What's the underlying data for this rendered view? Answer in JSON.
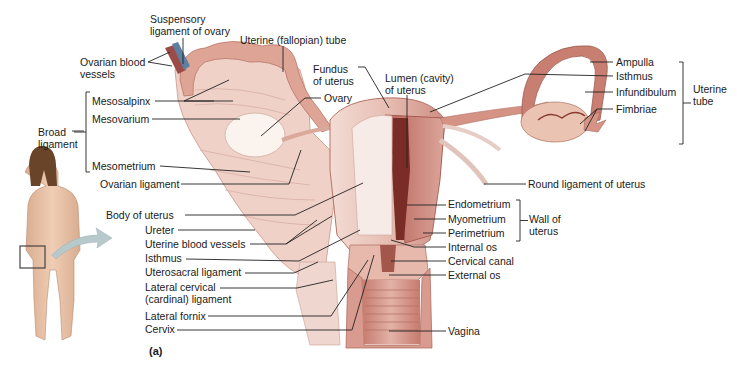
{
  "figure": {
    "panel_label": "(a)",
    "colors": {
      "tissue_light": "#f1d6cf",
      "tissue_mid": "#dba79c",
      "tissue_dark": "#a8554a",
      "lumen": "#7b2a26",
      "ovary": "#f6ece6",
      "tube": "#c97d70",
      "skin": "#e8c2a6",
      "hair": "#5a3a22",
      "arrow": "#b6c7c9",
      "leader": "#222222"
    }
  },
  "labels": [
    {
      "id": "suspensory-ligament",
      "text": "Suspensory\nligament of ovary",
      "x": 150,
      "y": 13,
      "lines": [
        [
          183,
          38,
          183,
          64
        ]
      ]
    },
    {
      "id": "ovarian-blood-vessels",
      "text": "Ovarian blood\nvessels",
      "x": 80,
      "y": 56,
      "lines": [
        [
          148,
          62,
          170,
          52
        ],
        [
          148,
          62,
          172,
          66
        ]
      ]
    },
    {
      "id": "uterine-tube-label",
      "text": "Uterine (fallopian) tube",
      "x": 240,
      "y": 34,
      "lines": [
        [
          283,
          46,
          283,
          72
        ]
      ]
    },
    {
      "id": "fundus",
      "text": "Fundus\nof uterus",
      "x": 313,
      "y": 63,
      "lines": [
        [
          358,
          67,
          365,
          67
        ],
        [
          365,
          67,
          389,
          108
        ]
      ]
    },
    {
      "id": "lumen",
      "text": "Lumen (cavity)\nof uterus",
      "x": 385,
      "y": 72,
      "lines": [
        [
          407,
          95,
          407,
          168
        ]
      ]
    },
    {
      "id": "ovary",
      "text": "Ovary",
      "x": 324,
      "y": 92,
      "lines": [
        [
          321,
          98,
          305,
          98
        ],
        [
          305,
          98,
          261,
          136
        ]
      ]
    },
    {
      "id": "mesosalpinx",
      "text": "Mesosalpinx",
      "x": 92,
      "y": 95,
      "lines": [
        [
          155,
          101,
          214,
          101
        ],
        [
          184,
          101,
          229,
          80
        ],
        [
          184,
          101,
          233,
          101
        ]
      ]
    },
    {
      "id": "mesovarium",
      "text": "Mesovarium",
      "x": 92,
      "y": 113,
      "lines": [
        [
          152,
          119,
          240,
          119
        ]
      ]
    },
    {
      "id": "broad-ligament",
      "text": "Broad\nligament",
      "x": 38,
      "y": 126,
      "lines": [
        [
          72,
          131,
          84,
          131
        ]
      ]
    },
    {
      "id": "mesometrium",
      "text": "Mesometrium",
      "x": 92,
      "y": 160,
      "lines": [
        [
          160,
          166,
          250,
          172
        ]
      ]
    },
    {
      "id": "ovarian-ligament",
      "text": "Ovarian ligament",
      "x": 100,
      "y": 178,
      "lines": [
        [
          181,
          184,
          289,
          184
        ],
        [
          289,
          184,
          301,
          150
        ]
      ]
    },
    {
      "id": "ampulla",
      "text": "Ampulla",
      "x": 616,
      "y": 56,
      "lines": [
        [
          590,
          62,
          613,
          62
        ]
      ]
    },
    {
      "id": "isthmus-tube",
      "text": "Isthmus",
      "x": 616,
      "y": 70,
      "lines": [
        [
          430,
          112,
          525,
          74
        ],
        [
          525,
          74,
          613,
          76
        ]
      ]
    },
    {
      "id": "infundibulum",
      "text": "Infundibulum",
      "x": 616,
      "y": 86,
      "lines": [
        [
          585,
          92,
          613,
          92
        ]
      ]
    },
    {
      "id": "fimbriae",
      "text": "Fimbriae",
      "x": 616,
      "y": 103,
      "lines": [
        [
          597,
          109,
          613,
          109
        ],
        [
          597,
          109,
          580,
          124
        ],
        [
          597,
          109,
          585,
          131
        ]
      ]
    },
    {
      "id": "uterine-tube-bracket",
      "text": "Uterine\ntube",
      "x": 693,
      "y": 83,
      "lines": []
    },
    {
      "id": "round-ligament",
      "text": "Round ligament of uterus",
      "x": 528,
      "y": 178,
      "lines": [
        [
          484,
          184,
          526,
          184
        ]
      ]
    },
    {
      "id": "endometrium",
      "text": "Endometrium",
      "x": 448,
      "y": 198,
      "lines": [
        [
          407,
          205,
          446,
          205
        ]
      ]
    },
    {
      "id": "myometrium",
      "text": "Myometrium",
      "x": 448,
      "y": 213,
      "lines": [
        [
          414,
          219,
          446,
          219
        ]
      ]
    },
    {
      "id": "perimetrium",
      "text": "Perimetrium",
      "x": 448,
      "y": 227,
      "lines": [
        [
          423,
          233,
          446,
          233
        ]
      ]
    },
    {
      "id": "wall-of-uterus",
      "text": "Wall of\nuterus",
      "x": 529,
      "y": 213,
      "lines": []
    },
    {
      "id": "internal-os",
      "text": "Internal os",
      "x": 448,
      "y": 241,
      "lines": [
        [
          391,
          240,
          414,
          247
        ],
        [
          414,
          247,
          446,
          247
        ]
      ]
    },
    {
      "id": "cervical-canal",
      "text": "Cervical canal",
      "x": 448,
      "y": 255,
      "lines": [
        [
          391,
          261,
          446,
          261
        ]
      ]
    },
    {
      "id": "external-os",
      "text": "External os",
      "x": 448,
      "y": 269,
      "lines": [
        [
          389,
          275,
          446,
          275
        ]
      ]
    },
    {
      "id": "vagina",
      "text": "Vagina",
      "x": 448,
      "y": 325,
      "lines": [
        [
          389,
          331,
          446,
          331
        ]
      ]
    },
    {
      "id": "body-of-uterus",
      "text": "Body of uterus",
      "x": 106,
      "y": 209,
      "lines": [
        [
          185,
          215,
          295,
          215
        ],
        [
          295,
          215,
          363,
          183
        ]
      ]
    },
    {
      "id": "ureter",
      "text": "Ureter",
      "x": 145,
      "y": 224,
      "lines": [
        [
          178,
          230,
          255,
          230
        ]
      ]
    },
    {
      "id": "uterine-blood-vessels",
      "text": "Uterine blood vessels",
      "x": 145,
      "y": 238,
      "lines": [
        [
          250,
          244,
          286,
          244
        ],
        [
          286,
          244,
          317,
          220
        ],
        [
          286,
          244,
          332,
          216
        ]
      ]
    },
    {
      "id": "isthmus-uterus",
      "text": "Isthmus",
      "x": 145,
      "y": 252,
      "lines": [
        [
          186,
          259,
          299,
          261
        ],
        [
          299,
          261,
          360,
          230
        ]
      ]
    },
    {
      "id": "uterosacral-ligament",
      "text": "Uterosacral ligament",
      "x": 145,
      "y": 266,
      "lines": [
        [
          245,
          273,
          294,
          273
        ],
        [
          294,
          273,
          318,
          262
        ]
      ]
    },
    {
      "id": "lateral-cervical-ligament",
      "text": "Lateral cervical\n(cardinal) ligament",
      "x": 145,
      "y": 281,
      "lines": [
        [
          220,
          288,
          297,
          288
        ],
        [
          297,
          288,
          333,
          280
        ]
      ]
    },
    {
      "id": "lateral-fornix",
      "text": "Lateral fornix",
      "x": 145,
      "y": 310,
      "lines": [
        [
          208,
          316,
          331,
          316
        ],
        [
          331,
          316,
          368,
          260
        ]
      ]
    },
    {
      "id": "cervix",
      "text": "Cervix",
      "x": 145,
      "y": 323,
      "lines": [
        [
          177,
          330,
          352,
          330
        ],
        [
          352,
          330,
          374,
          255
        ]
      ]
    }
  ],
  "brackets": [
    {
      "id": "broad-ligament-bracket",
      "x": 86,
      "y1": 92,
      "y2": 172,
      "tick": "right"
    },
    {
      "id": "uterine-tube-bracket",
      "x": 683,
      "y1": 62,
      "y2": 144,
      "tick": "left"
    },
    {
      "id": "wall-of-uterus-bracket",
      "x": 520,
      "y1": 200,
      "y2": 241,
      "tick": "left"
    }
  ]
}
